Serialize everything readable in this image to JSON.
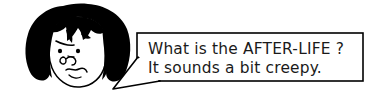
{
  "scene": {
    "kind": "cartoon-illustration",
    "background_color": "#ffffff",
    "ink_color": "#000000",
    "character": {
      "name": "worried-girl",
      "hair_color": "#000000",
      "skin_color": "#ffffff",
      "expression": "worried",
      "features": [
        "black-bob-hair",
        "jagged-bangs",
        "angled-eyebrow",
        "two-dot-eyes",
        "curled-nose",
        "wavy-worried-mouth"
      ]
    },
    "speech_bubble": {
      "shape": "rectangle-with-pointed-tail",
      "tail_direction": "left",
      "border_color": "#000000",
      "fill_color": "#ffffff",
      "lines": [
        "What is the AFTER-LIFE ?",
        "It sounds a bit creepy."
      ]
    }
  }
}
